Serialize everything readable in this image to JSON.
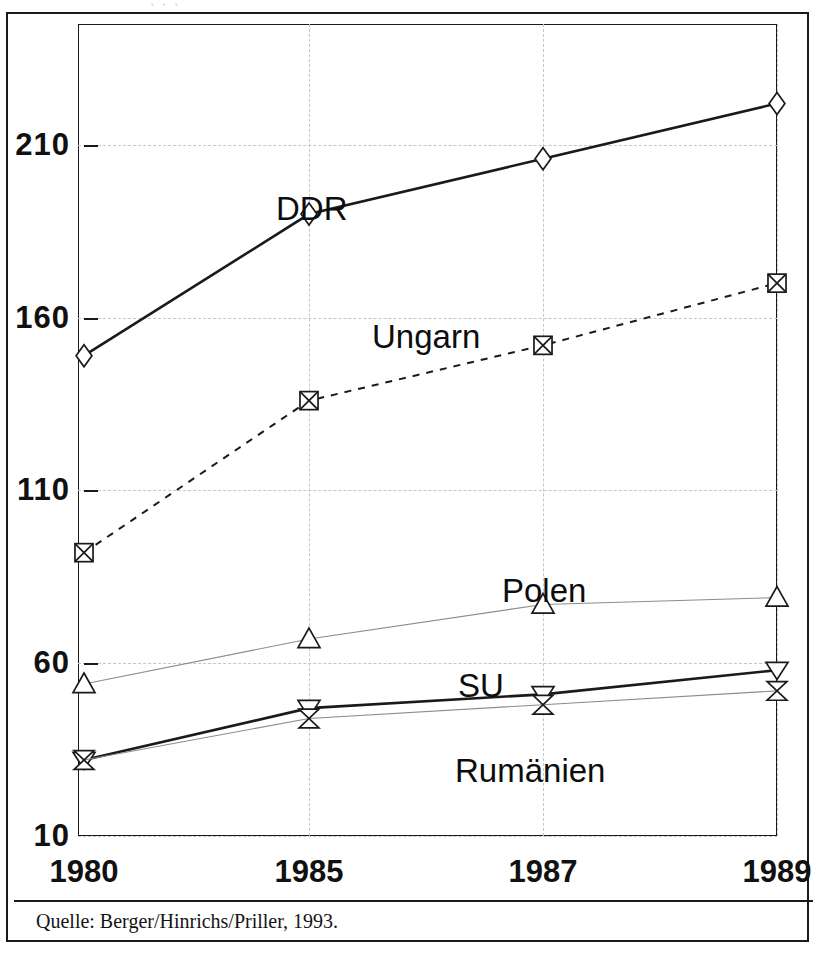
{
  "figure": {
    "top_partial_text": "· · ·",
    "source_note": "Quelle: Berger/Hinrichs/Priller, 1993."
  },
  "axes": {
    "y_ticks": [
      "210",
      "160",
      "110",
      "60",
      "10"
    ],
    "x_ticks": [
      "1980",
      "1985",
      "1987",
      "1989"
    ]
  },
  "series_labels": {
    "ddr": "DDR",
    "ungarn": "Ungarn",
    "polen": "Polen",
    "su": "SU",
    "rumaenien": "Rumänien"
  },
  "colors": {
    "ink": "#1a1a1a",
    "grid": "#c6c6c6",
    "light_line": "#8c8c8c"
  },
  "chart_data": {
    "type": "line",
    "title": "",
    "subtitle": "",
    "xlabel": "",
    "ylabel": "",
    "x": [
      "1980",
      "1985",
      "1987",
      "1989"
    ],
    "ylim": [
      10,
      245
    ],
    "y_ticks": [
      210,
      160,
      110,
      60,
      10
    ],
    "grid": true,
    "legend": "inline-labels",
    "series": [
      {
        "name": "DDR",
        "values": [
          149,
          190,
          206,
          222
        ],
        "marker": "diamond",
        "line_style": "solid",
        "line_weight": "heavy",
        "label_position": {
          "x": 270,
          "y": 178
        }
      },
      {
        "name": "Ungarn",
        "values": [
          92,
          136,
          152,
          170
        ],
        "marker": "square-with-x",
        "line_style": "dashed",
        "line_weight": "medium",
        "label_position": {
          "x": 366,
          "y": 306
        }
      },
      {
        "name": "Polen",
        "values": [
          54,
          67,
          77,
          79
        ],
        "marker": "triangle-up",
        "line_style": "solid",
        "line_weight": "light",
        "label_position": {
          "x": 496,
          "y": 560
        }
      },
      {
        "name": "SU",
        "values": [
          32,
          47,
          51,
          58
        ],
        "marker": "triangle-down",
        "line_style": "solid",
        "line_weight": "heavy",
        "label_position": {
          "x": 452,
          "y": 655
        }
      },
      {
        "name": "Rumänien",
        "values": [
          32,
          44,
          48,
          52
        ],
        "marker": "hourglass",
        "line_style": "solid",
        "line_weight": "light",
        "label_position": {
          "x": 449,
          "y": 740
        }
      }
    ],
    "annotations": [
      {
        "text": "Quelle: Berger/Hinrichs/Priller, 1993.",
        "position": "below-axes"
      }
    ]
  }
}
